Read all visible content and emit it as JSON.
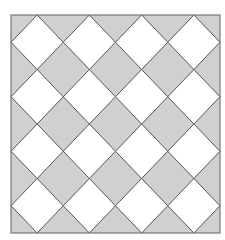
{
  "figure": {
    "frame": {
      "x": 11,
      "y": 15,
      "width": 209,
      "height": 218
    },
    "grid": {
      "columns": 4,
      "rows": 4
    },
    "colors": {
      "background": "#ffffff",
      "gray_tile": "#d0d0d0",
      "white_tile": "#ffffff",
      "tile_edge": "#555555",
      "frame_edge": "#777777"
    }
  }
}
